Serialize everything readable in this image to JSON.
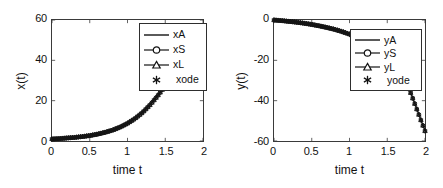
{
  "figure": {
    "panels": [
      {
        "id": "x-panel",
        "axis": {
          "xlabel": "time t",
          "ylabel": "x(t)",
          "xticks": [
            "0",
            "0.5",
            "1",
            "1.5",
            "2"
          ],
          "yticks": [
            "0",
            "20",
            "40",
            "60"
          ],
          "xlim": [
            0,
            2
          ],
          "ylim": [
            0,
            60
          ]
        },
        "legend": {
          "entries": [
            {
              "label": "xA",
              "marker": "none",
              "line": true
            },
            {
              "label": "xS",
              "marker": "circle",
              "line": true
            },
            {
              "label": "xL",
              "marker": "triangle",
              "line": true
            },
            {
              "label": "xode",
              "marker": "asterisk",
              "line": false
            }
          ]
        }
      },
      {
        "id": "y-panel",
        "axis": {
          "xlabel": "time t",
          "ylabel": "y(t)",
          "xticks": [
            "0",
            "0.5",
            "1",
            "1.5",
            "2"
          ],
          "yticks": [
            "0",
            "-20",
            "-40",
            "-60"
          ],
          "xlim": [
            0,
            2
          ],
          "ylim": [
            -60,
            0
          ]
        },
        "legend": {
          "entries": [
            {
              "label": "yA",
              "marker": "none",
              "line": true
            },
            {
              "label": "yS",
              "marker": "circle",
              "line": true
            },
            {
              "label": "yL",
              "marker": "triangle",
              "line": true
            },
            {
              "label": "yode",
              "marker": "asterisk",
              "line": false
            }
          ]
        }
      }
    ]
  },
  "colors": {
    "axis": "#3a3a3a",
    "curve": "#141414",
    "background": "#ffffff"
  },
  "chart_data": [
    {
      "type": "line",
      "title": "",
      "xlabel": "time t",
      "ylabel": "x(t)",
      "xlim": [
        0,
        2
      ],
      "ylim": [
        0,
        60
      ],
      "xticks": [
        0,
        0.5,
        1,
        1.5,
        2
      ],
      "yticks": [
        0,
        20,
        40,
        60
      ],
      "grid": false,
      "legend_position": "upper-right",
      "x": [
        0,
        0.1,
        0.2,
        0.3,
        0.4,
        0.5,
        0.6,
        0.7,
        0.8,
        0.9,
        1.0,
        1.1,
        1.2,
        1.3,
        1.4,
        1.5,
        1.6,
        1.7,
        1.8,
        1.9,
        2.0
      ],
      "series": [
        {
          "name": "xA",
          "marker": "none",
          "values": [
            1.0,
            1.2,
            1.5,
            1.8,
            2.2,
            2.7,
            3.4,
            4.3,
            5.4,
            6.9,
            8.8,
            11.2,
            14.2,
            18.0,
            22.5,
            27.5,
            33.0,
            39.0,
            45.0,
            50.5,
            55.0
          ]
        },
        {
          "name": "xS",
          "marker": "circle",
          "values": [
            1.0,
            1.2,
            1.5,
            1.8,
            2.2,
            2.7,
            3.4,
            4.3,
            5.4,
            6.9,
            8.8,
            11.2,
            14.2,
            18.0,
            22.5,
            27.5,
            33.0,
            39.0,
            45.0,
            50.5,
            55.0
          ]
        },
        {
          "name": "xL",
          "marker": "triangle",
          "values": [
            1.0,
            1.2,
            1.5,
            1.8,
            2.2,
            2.7,
            3.4,
            4.3,
            5.4,
            6.9,
            8.8,
            11.2,
            14.2,
            18.0,
            22.5,
            27.5,
            33.0,
            39.0,
            45.0,
            50.5,
            55.0
          ]
        },
        {
          "name": "xode",
          "marker": "asterisk",
          "values": [
            1.0,
            1.2,
            1.5,
            1.8,
            2.2,
            2.7,
            3.4,
            4.3,
            5.4,
            6.9,
            8.8,
            11.2,
            14.2,
            18.0,
            22.5,
            27.5,
            33.0,
            39.0,
            45.0,
            50.5,
            55.0
          ]
        }
      ]
    },
    {
      "type": "line",
      "title": "",
      "xlabel": "time t",
      "ylabel": "y(t)",
      "xlim": [
        0,
        2
      ],
      "ylim": [
        -60,
        0
      ],
      "xticks": [
        0,
        0.5,
        1,
        1.5,
        2
      ],
      "yticks": [
        -60,
        -40,
        -20,
        0
      ],
      "grid": false,
      "legend_position": "center-right",
      "x": [
        0,
        0.1,
        0.2,
        0.3,
        0.4,
        0.5,
        0.6,
        0.7,
        0.8,
        0.9,
        1.0,
        1.1,
        1.2,
        1.3,
        1.4,
        1.5,
        1.6,
        1.7,
        1.8,
        1.9,
        2.0
      ],
      "series": [
        {
          "name": "yA",
          "marker": "none",
          "values": [
            0.0,
            -0.3,
            -0.7,
            -1.1,
            -1.6,
            -2.2,
            -2.9,
            -3.7,
            -4.6,
            -5.7,
            -7.0,
            -8.6,
            -10.6,
            -13.2,
            -16.4,
            -20.4,
            -25.0,
            -29.8,
            -35.0,
            -45.0,
            -55.0
          ]
        },
        {
          "name": "yS",
          "marker": "circle",
          "values": [
            0.0,
            -0.3,
            -0.7,
            -1.1,
            -1.6,
            -2.2,
            -2.9,
            -3.7,
            -4.6,
            -5.7,
            -7.0,
            -8.6,
            -10.6,
            -13.2,
            -16.4,
            -20.4,
            -25.0,
            -29.8,
            -35.0,
            -45.0,
            -55.0
          ]
        },
        {
          "name": "yL",
          "marker": "triangle",
          "values": [
            0.0,
            -0.3,
            -0.7,
            -1.1,
            -1.6,
            -2.2,
            -2.9,
            -3.7,
            -4.6,
            -5.7,
            -7.0,
            -8.6,
            -10.6,
            -13.2,
            -16.4,
            -20.4,
            -25.0,
            -29.8,
            -35.0,
            -45.0,
            -55.0
          ]
        },
        {
          "name": "yode",
          "marker": "asterisk",
          "values": [
            0.0,
            -0.3,
            -0.7,
            -1.1,
            -1.6,
            -2.2,
            -2.9,
            -3.7,
            -4.6,
            -5.7,
            -7.0,
            -8.6,
            -10.6,
            -13.2,
            -16.4,
            -20.4,
            -25.0,
            -29.8,
            -35.0,
            -45.0,
            -55.0
          ]
        }
      ]
    }
  ]
}
